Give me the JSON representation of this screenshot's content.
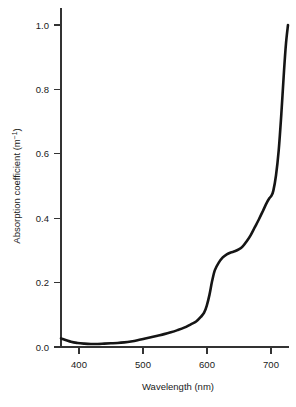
{
  "chart_data": {
    "type": "line",
    "title": "",
    "subtitle": "",
    "xlabel": "Wavelength (nm)",
    "ylabel": "Absorption coefficient (m",
    "ylabel_superscript": "−1",
    "ylabel_suffix": ")",
    "ylabel_full": "Absorption coefficient (m⁻¹)",
    "xlim": [
      375,
      716
    ],
    "ylim": [
      0.0,
      1.05
    ],
    "xticks": [
      400,
      500,
      600,
      700
    ],
    "xtick_labels": [
      "400",
      "500",
      "600",
      "700"
    ],
    "yticks": [
      0.0,
      0.2,
      0.4,
      0.6,
      0.8,
      1.0
    ],
    "ytick_labels": [
      "0.0",
      "0.2",
      "0.4",
      "0.6",
      "0.8",
      "1.0"
    ],
    "grid": false,
    "legend": null,
    "series": [
      {
        "name": "Absorption coefficient of pure water",
        "color": "#151515",
        "x": [
          375,
          390,
          400,
          410,
          420,
          430,
          440,
          450,
          460,
          470,
          480,
          490,
          500,
          510,
          520,
          530,
          540,
          550,
          560,
          570,
          578,
          585,
          590,
          594,
          598,
          602,
          606,
          612,
          618,
          624,
          630,
          636,
          642,
          648,
          654,
          660,
          666,
          672,
          678,
          684,
          688,
          691,
          694,
          698,
          702,
          706,
          710,
          713,
          716
        ],
        "y": [
          0.028,
          0.017,
          0.013,
          0.011,
          0.01,
          0.01,
          0.011,
          0.012,
          0.013,
          0.015,
          0.018,
          0.022,
          0.027,
          0.032,
          0.037,
          0.042,
          0.048,
          0.055,
          0.063,
          0.074,
          0.083,
          0.098,
          0.112,
          0.135,
          0.17,
          0.215,
          0.25,
          0.275,
          0.292,
          0.302,
          0.308,
          0.312,
          0.318,
          0.328,
          0.345,
          0.365,
          0.39,
          0.415,
          0.442,
          0.47,
          0.485,
          0.493,
          0.51,
          0.56,
          0.64,
          0.76,
          0.9,
          0.99,
          1.05
        ]
      }
    ]
  },
  "axes_geometry": {
    "x_axis_pixel_range": [
      61,
      288
    ],
    "y_axis_pixel_range": [
      347,
      25
    ]
  }
}
